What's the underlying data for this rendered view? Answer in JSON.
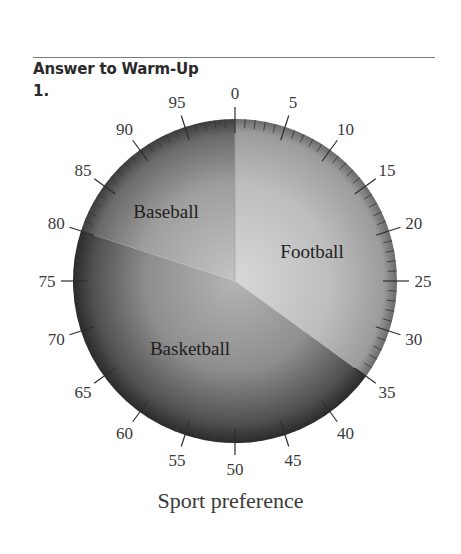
{
  "header": {
    "title": "Answer to Warm-Up",
    "item_number": "1."
  },
  "chart_data": {
    "type": "pie",
    "title": "Sport preference",
    "dial": {
      "min": 0,
      "max": 100,
      "major_step": 5,
      "minor_step": 1,
      "tick_labels": [
        "0",
        "5",
        "10",
        "15",
        "20",
        "25",
        "30",
        "35",
        "40",
        "45",
        "50",
        "55",
        "60",
        "65",
        "70",
        "75",
        "80",
        "85",
        "90",
        "95"
      ]
    },
    "categories": [
      "Football",
      "Basketball",
      "Baseball"
    ],
    "values": [
      35,
      45,
      20
    ],
    "boundaries": [
      [
        0,
        35
      ],
      [
        35,
        80
      ],
      [
        80,
        100
      ]
    ],
    "colors": [
      "#b8b8b8",
      "#8c8c8c",
      "#9a9a9a"
    ],
    "legend": "none (labels inside slices)"
  },
  "caption": "Sport preference"
}
